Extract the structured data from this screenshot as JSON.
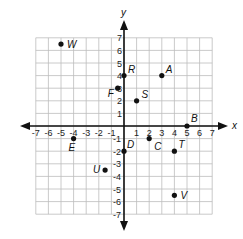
{
  "diagram": {
    "type": "coordinate-plane",
    "axes": {
      "x_label": "x",
      "y_label": "y",
      "x_range": [
        -7,
        7
      ],
      "y_range": [
        -7,
        7
      ],
      "x_ticks": [
        "-7",
        "-6",
        "-5",
        "-4",
        "-3",
        "-2",
        "-1",
        "1",
        "2",
        "3",
        "4",
        "5",
        "6",
        "7"
      ],
      "y_ticks": [
        "7",
        "6",
        "5",
        "4",
        "3",
        "2",
        "1",
        "-1",
        "-2",
        "-3",
        "-4",
        "-5",
        "-6",
        "-7"
      ]
    },
    "grid": {
      "on": true,
      "spacing": 1
    },
    "points": [
      {
        "label": "W",
        "x": -5,
        "y": 6.5
      },
      {
        "label": "A",
        "x": 3,
        "y": 4
      },
      {
        "label": "R",
        "x": 0,
        "y": 4
      },
      {
        "label": "F",
        "x": -0.5,
        "y": 3
      },
      {
        "label": "S",
        "x": 1,
        "y": 2
      },
      {
        "label": "B",
        "x": 5,
        "y": 0
      },
      {
        "label": "E",
        "x": -4,
        "y": -1
      },
      {
        "label": "C",
        "x": 2,
        "y": -1
      },
      {
        "label": "D",
        "x": 0,
        "y": -2
      },
      {
        "label": "T",
        "x": 4,
        "y": -2
      },
      {
        "label": "U",
        "x": -1.5,
        "y": -3.5
      },
      {
        "label": "V",
        "x": 4,
        "y": -5.5
      }
    ]
  },
  "colors": {
    "grid": "#bdbdbd",
    "axis": "#111111",
    "point": "#111111",
    "background": "#ffffff"
  }
}
